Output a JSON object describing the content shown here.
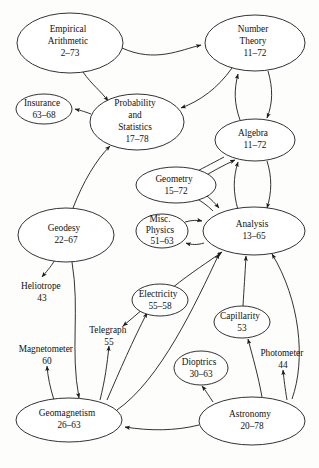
{
  "diagram": {
    "background_color": "#fdfdfc",
    "stroke_color": "#1c1c1c",
    "text_color": "#111111",
    "nodes": [
      {
        "id": "empirical-arithmetic",
        "lines": [
          "Empirical",
          "Arithmetic"
        ],
        "range": "2–73",
        "cx": 70,
        "cy": 43,
        "rx": 53,
        "ry": 30
      },
      {
        "id": "number-theory",
        "lines": [
          "Number",
          "Theory"
        ],
        "range": "11–72",
        "cx": 255,
        "cy": 43,
        "rx": 50,
        "ry": 28
      },
      {
        "id": "insurance",
        "lines": [
          "Insurance"
        ],
        "range": "63–68",
        "cx": 44,
        "cy": 109,
        "rx": 28,
        "ry": 15
      },
      {
        "id": "probability-statistics",
        "lines": [
          "Probability",
          "and",
          "Statistics"
        ],
        "range": "17–78",
        "cx": 137,
        "cy": 122,
        "rx": 47,
        "ry": 28
      },
      {
        "id": "algebra",
        "lines": [
          "Algebra"
        ],
        "range": "11–72",
        "cx": 255,
        "cy": 140,
        "rx": 40,
        "ry": 21
      },
      {
        "id": "geometry",
        "lines": [
          "Geometry"
        ],
        "range": "15–72",
        "cx": 176,
        "cy": 185,
        "rx": 40,
        "ry": 18
      },
      {
        "id": "misc-physics",
        "lines": [
          "Misc.",
          "Physics"
        ],
        "range": "51–63",
        "cx": 162,
        "cy": 231,
        "rx": 26,
        "ry": 17
      },
      {
        "id": "analysis",
        "lines": [
          "Analysis"
        ],
        "range": "13–65",
        "cx": 254,
        "cy": 231,
        "rx": 51,
        "ry": 24
      },
      {
        "id": "geodesy",
        "lines": [
          "Geodesy"
        ],
        "range": "22–67",
        "cx": 66,
        "cy": 235,
        "rx": 48,
        "ry": 27
      },
      {
        "id": "electricity",
        "lines": [
          "Electricity"
        ],
        "range": "55–58",
        "cx": 160,
        "cy": 300,
        "rx": 28,
        "ry": 16
      },
      {
        "id": "capillarity",
        "lines": [
          "Capillarity"
        ],
        "range": "53",
        "cx": 242,
        "cy": 322,
        "rx": 28,
        "ry": 16
      },
      {
        "id": "dioptrics",
        "lines": [
          "Dioptrics"
        ],
        "range": "30–63",
        "cx": 201,
        "cy": 368,
        "rx": 27,
        "ry": 17
      },
      {
        "id": "geomagnetism",
        "lines": [
          "Geomagnetism"
        ],
        "range": "26–63",
        "cx": 69,
        "cy": 420,
        "rx": 53,
        "ry": 22
      },
      {
        "id": "astronomy",
        "lines": [
          "Astronomy"
        ],
        "range": "20–78",
        "cx": 252,
        "cy": 421,
        "rx": 53,
        "ry": 24
      }
    ],
    "free_labels": [
      {
        "id": "heliotrope",
        "name": "Heliotrope",
        "value": "43",
        "x": 42,
        "y": 289
      },
      {
        "id": "telegraph",
        "name": "Telegraph",
        "value": "55",
        "x": 109,
        "y": 333
      },
      {
        "id": "magnetometer",
        "name": "Magnetometer",
        "value": "60",
        "x": 47,
        "y": 352
      },
      {
        "id": "photometer",
        "name": "Photometer",
        "value": "44",
        "x": 283,
        "y": 356
      }
    ],
    "edges": [
      {
        "id": "empirical-to-number-theory",
        "from": "empirical-arithmetic",
        "to": "number-theory"
      },
      {
        "id": "empirical-to-probability",
        "from": "empirical-arithmetic",
        "to": "probability-statistics"
      },
      {
        "id": "number-theory-to-probability",
        "from": "number-theory",
        "to": "probability-statistics"
      },
      {
        "id": "number-theory-to-algebra",
        "from": "number-theory",
        "to": "algebra"
      },
      {
        "id": "algebra-to-number-theory",
        "from": "algebra",
        "to": "number-theory"
      },
      {
        "id": "probability-to-insurance",
        "from": "probability-statistics",
        "to": "insurance"
      },
      {
        "id": "geodesy-to-probability",
        "from": "geodesy",
        "to": "probability-statistics"
      },
      {
        "id": "algebra-to-geometry",
        "from": "algebra",
        "to": "geometry"
      },
      {
        "id": "geometry-to-algebra",
        "from": "geometry",
        "to": "algebra"
      },
      {
        "id": "algebra-to-analysis",
        "from": "algebra",
        "to": "analysis"
      },
      {
        "id": "analysis-to-algebra",
        "from": "analysis",
        "to": "algebra"
      },
      {
        "id": "geometry-to-analysis",
        "from": "geometry",
        "to": "analysis"
      },
      {
        "id": "analysis-to-geometry",
        "from": "analysis",
        "to": "geometry"
      },
      {
        "id": "misc-physics-to-analysis",
        "from": "misc-physics",
        "to": "analysis"
      },
      {
        "id": "analysis-to-misc-physics",
        "from": "analysis",
        "to": "misc-physics"
      },
      {
        "id": "geodesy-to-heliotrope",
        "from": "geodesy",
        "to": "heliotrope"
      },
      {
        "id": "geodesy-to-geomagnetism",
        "from": "geodesy",
        "to": "geomagnetism"
      },
      {
        "id": "geomagnetism-to-magnetometer",
        "from": "geomagnetism",
        "to": "magnetometer"
      },
      {
        "id": "geomagnetism-to-telegraph",
        "from": "geomagnetism",
        "to": "telegraph"
      },
      {
        "id": "geomagnetism-to-electricity",
        "from": "geomagnetism",
        "to": "electricity"
      },
      {
        "id": "geomagnetism-to-analysis",
        "from": "geomagnetism",
        "to": "analysis"
      },
      {
        "id": "electricity-to-telegraph",
        "from": "electricity",
        "to": "telegraph"
      },
      {
        "id": "electricity-to-analysis",
        "from": "electricity",
        "to": "analysis"
      },
      {
        "id": "capillarity-to-analysis",
        "from": "capillarity",
        "to": "analysis"
      },
      {
        "id": "astronomy-to-geomagnetism",
        "from": "astronomy",
        "to": "geomagnetism"
      },
      {
        "id": "astronomy-to-dioptrics",
        "from": "astronomy",
        "to": "dioptrics"
      },
      {
        "id": "astronomy-to-photometer",
        "from": "astronomy",
        "to": "photometer"
      },
      {
        "id": "astronomy-to-capillarity",
        "from": "astronomy",
        "to": "capillarity"
      },
      {
        "id": "astronomy-to-analysis",
        "from": "astronomy",
        "to": "analysis"
      }
    ]
  }
}
